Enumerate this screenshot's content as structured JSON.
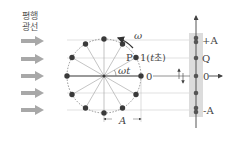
{
  "title_label": {
    "line1": "평행",
    "line2": "광선"
  },
  "circle": {
    "point_P": "P",
    "point_1": "1(",
    "t_var": "t",
    "seconds_unit": "초)",
    "omega": "ω",
    "omega_t": "ωt",
    "zero": "0",
    "radius_label": "A"
  },
  "axis": {
    "plus_A": "+A",
    "Q": "Q",
    "zero": "0",
    "minus_A": "-A"
  },
  "colors": {
    "dot": "#3a3a3a",
    "arrow": "#9a9a9a",
    "band": "#d9d9d9",
    "line": "#888888"
  }
}
